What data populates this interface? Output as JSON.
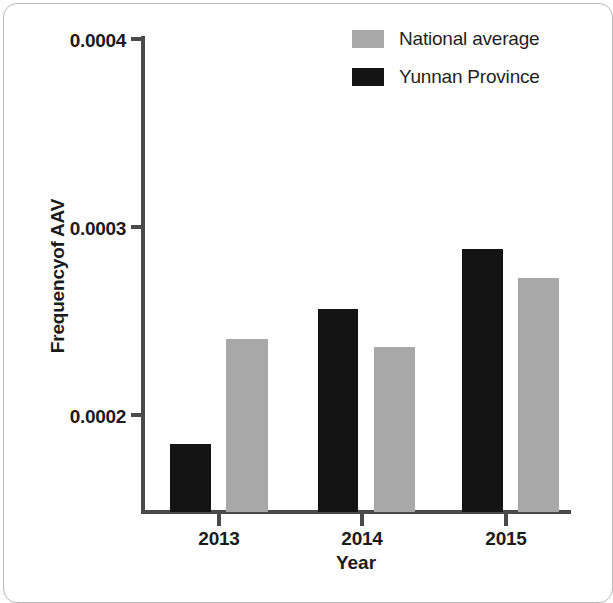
{
  "chart_data": {
    "type": "bar",
    "title": "",
    "xlabel": "Year",
    "ylabel": "Frequencyof AAV",
    "categories": [
      "2013",
      "2014",
      "2015"
    ],
    "series": [
      {
        "name": "National average",
        "color": "#a8a8a8",
        "values": [
          0.000239,
          0.000235,
          0.000272
        ]
      },
      {
        "name": "Yunnan Province",
        "color": "#141414",
        "values": [
          0.000184,
          0.000255,
          0.000287
        ]
      }
    ],
    "ylim": [
      0.0001474,
      0.0004
    ],
    "yticks": [
      0.0002,
      0.0003,
      0.0004
    ],
    "ytick_labels": [
      "0.0002",
      "0.0003",
      "0.0004"
    ],
    "xtick_labels": [
      "2013",
      "2014",
      "2015"
    ],
    "grid": false,
    "legend_position": "top-right",
    "axis_color": "#4a4a4a"
  },
  "axes": {
    "y_title": "Frequencyof AAV",
    "x_title": "Year",
    "y_ticks": [
      {
        "label": "0.0004",
        "top": 30
      },
      {
        "label": "0.0003",
        "top": 218
      },
      {
        "label": "0.0002",
        "top": 406
      }
    ],
    "x_ticks": [
      {
        "label": "2013",
        "left": 174
      },
      {
        "label": "2014",
        "left": 317
      },
      {
        "label": "2015",
        "left": 461
      }
    ]
  },
  "legend": {
    "entries": [
      {
        "label": "National average",
        "swatch": "national"
      },
      {
        "label": "Yunnan Province",
        "swatch": "yunnan"
      }
    ]
  },
  "bars": [
    {
      "group": "2013",
      "series": "yunnan",
      "left": 170,
      "width": 41,
      "height": 68
    },
    {
      "group": "2013",
      "series": "national",
      "left": 226,
      "width": 42,
      "height": 173
    },
    {
      "group": "2014",
      "series": "yunnan",
      "left": 318,
      "width": 40,
      "height": 203
    },
    {
      "group": "2014",
      "series": "national",
      "left": 374,
      "width": 41,
      "height": 165
    },
    {
      "group": "2015",
      "series": "yunnan",
      "left": 462,
      "width": 41,
      "height": 263
    },
    {
      "group": "2015",
      "series": "national",
      "left": 518,
      "width": 41,
      "height": 234
    }
  ]
}
